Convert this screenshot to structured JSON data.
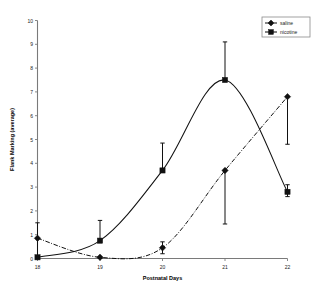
{
  "chart_data": {
    "type": "line",
    "title": "",
    "xlabel": "Postnatal Days",
    "ylabel": "Flank Marking (average)",
    "x": [
      18,
      19,
      20,
      21,
      22
    ],
    "xtick_labels": [
      "18",
      "19",
      "20",
      "21",
      "22"
    ],
    "ytick_labels": [
      "0",
      "1",
      "2",
      "3",
      "4",
      "5",
      "6",
      "7",
      "8",
      "9",
      "10"
    ],
    "xlim": [
      18,
      22
    ],
    "ylim": [
      0,
      10
    ],
    "grid": false,
    "legend_position": "top-right",
    "series": [
      {
        "name": "saline",
        "marker": "diamond",
        "linestyle": "dash-dot",
        "color": "#111111",
        "values": [
          0.85,
          0.05,
          0.45,
          3.7,
          6.8
        ],
        "err_low": [
          0.0,
          0.0,
          0.2,
          1.45,
          4.8
        ],
        "err_high": [
          1.5,
          0.05,
          0.7,
          3.7,
          6.8
        ]
      },
      {
        "name": "nicotine",
        "marker": "square",
        "linestyle": "solid",
        "color": "#111111",
        "values": [
          0.05,
          0.75,
          3.7,
          7.5,
          2.8
        ],
        "err_low": [
          0.0,
          0.75,
          3.7,
          7.5,
          2.6
        ],
        "err_high": [
          0.05,
          1.6,
          4.85,
          9.1,
          3.1
        ]
      }
    ]
  },
  "legend": {
    "entries": [
      {
        "label": "saline"
      },
      {
        "label": "nicotine"
      }
    ]
  }
}
